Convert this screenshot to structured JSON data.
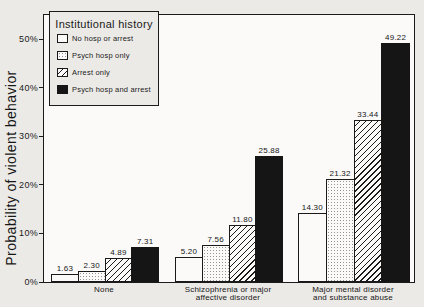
{
  "chart_data": {
    "type": "bar",
    "title": "",
    "ylabel": "Probability of violent behavior",
    "xlabel": "",
    "ylim": [
      0,
      55
    ],
    "grid": false,
    "yticks": [
      {
        "value": 0,
        "label": "0%"
      },
      {
        "value": 10,
        "label": "10%"
      },
      {
        "value": 20,
        "label": "20%"
      },
      {
        "value": 30,
        "label": "30%"
      },
      {
        "value": 40,
        "label": "40%"
      },
      {
        "value": 50,
        "label": "50%"
      }
    ],
    "legend": {
      "title": "Institutional history",
      "position": "upper-left-inside"
    },
    "categories": [
      [
        "None"
      ],
      [
        "Schizophrenia or major",
        "affective disorder"
      ],
      [
        "Major mental disorder",
        "and substance abuse"
      ]
    ],
    "series": [
      {
        "name": "No hosp or arrest",
        "pattern": "plain",
        "values": [
          1.63,
          5.2,
          14.3
        ],
        "labels": [
          "1.63",
          "5.20",
          "14.30"
        ]
      },
      {
        "name": "Psych hosp only",
        "pattern": "dots",
        "values": [
          2.3,
          7.56,
          21.32
        ],
        "labels": [
          "2.30",
          "7.56",
          "21.32"
        ]
      },
      {
        "name": "Arrest only",
        "pattern": "diagonal-hatch",
        "values": [
          4.89,
          11.8,
          33.44
        ],
        "labels": [
          "4.89",
          "11.80",
          "33.44"
        ]
      },
      {
        "name": "Psych hosp and arrest",
        "pattern": "solid-black",
        "values": [
          7.31,
          25.88,
          49.22
        ],
        "labels": [
          "7.31",
          "25.88",
          "49.22"
        ]
      }
    ],
    "colors": {
      "ink": "#1a1a1a",
      "paper": "#eceae7",
      "plot_background": "#fbfaf9",
      "bar_fill": "#fbfaf9",
      "bar_solid": "#151515"
    }
  }
}
